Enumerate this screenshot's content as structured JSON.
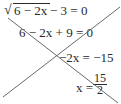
{
  "equations": [
    {
      "radical_sign": "√",
      "radicand": "6 − 2x",
      "rest": " − 3 = 0"
    },
    {
      "text": "6 − 2x + 9 = 0"
    },
    {
      "text": "−2x = −15"
    },
    {
      "lhs": "x = ",
      "numerator": "15",
      "denominator": "2"
    }
  ],
  "strike_lines": [
    {
      "x1": 3,
      "y1": 97,
      "x2": 120,
      "y2": 7
    },
    {
      "x1": 8,
      "y1": 18,
      "x2": 118,
      "y2": 103
    }
  ],
  "colors": {
    "text": "#2a2a2a",
    "strike": "#6a6a6a"
  }
}
